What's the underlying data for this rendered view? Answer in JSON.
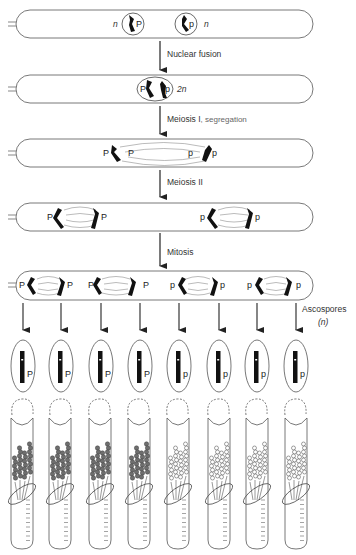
{
  "diagram": {
    "title": "",
    "stages": [
      {
        "id": "stage-1",
        "label": "",
        "ploidy_left": "n",
        "ploidy_right": "n",
        "nuclei": [
          {
            "allele": "P"
          },
          {
            "allele": "p"
          }
        ]
      },
      {
        "id": "stage-2",
        "arrow_label": "Nuclear fusion",
        "ploidy": "2n",
        "nuclei": [
          {
            "alleles": [
              "P",
              "p"
            ]
          }
        ]
      },
      {
        "id": "stage-3",
        "arrow_label": "Meiosis I",
        "arrow_sublabel": ", segregation",
        "alleles": [
          "P",
          "P",
          "p",
          "p"
        ]
      },
      {
        "id": "stage-4",
        "arrow_label": "Meiosis II",
        "alleles": [
          "P",
          "P",
          "p",
          "p"
        ]
      },
      {
        "id": "stage-5",
        "arrow_label": "Mitosis",
        "alleles": [
          "P",
          "P",
          "P",
          "P",
          "p",
          "p",
          "p",
          "p"
        ]
      }
    ],
    "ascospores": {
      "label": "Ascospores",
      "ploidy": "(n)",
      "alleles": [
        "P",
        "P",
        "P",
        "P",
        "p",
        "p",
        "p",
        "p"
      ]
    },
    "tubes": {
      "phenotypes": [
        "pigmented",
        "pigmented",
        "pigmented",
        "pigmented",
        "unpigmented",
        "unpigmented",
        "unpigmented",
        "unpigmented"
      ]
    },
    "colors": {
      "line": "#555555",
      "chromosome": "#111111",
      "pigmented_colony": "#6e6e6e",
      "unpigmented_colony": "#ffffff"
    }
  }
}
